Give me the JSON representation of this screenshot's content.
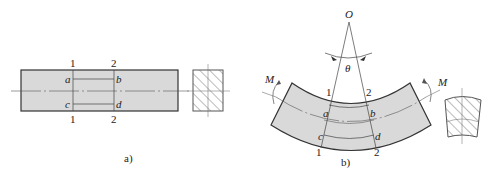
{
  "figure_a": {
    "caption": "a)",
    "section_labels": {
      "line1_top": "1",
      "line2_top": "2",
      "line1_bottom": "1",
      "line2_bottom": "2"
    },
    "points": {
      "a": "a",
      "b": "b",
      "c": "c",
      "d": "d"
    }
  },
  "figure_b": {
    "caption": "b)",
    "center_label": "O",
    "angle_label": "θ",
    "moment_left": "M",
    "moment_right": "M",
    "section_labels": {
      "line1_top": "1",
      "line2_top": "2",
      "line1_bottom": "1",
      "line2_bottom": "2"
    },
    "points": {
      "a": "a",
      "b": "b",
      "c": "c",
      "d": "d"
    }
  },
  "colors": {
    "fill": "#d9d9d9",
    "stroke": "#333333",
    "hatch": "#555555"
  }
}
